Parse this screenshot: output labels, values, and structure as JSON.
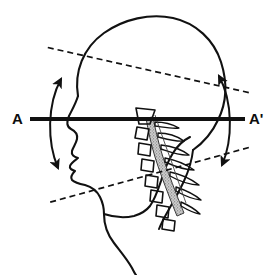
{
  "figure": {
    "kind": "anatomical-line-drawing",
    "background_color": "#ffffff",
    "ink_color": "#111111",
    "width": 276,
    "height": 275
  },
  "labels": {
    "axis_left": "A",
    "axis_right": "A'"
  },
  "reference_axis": {
    "name": "horizontal-reference-line-A-A-prime",
    "description": "thick solid horizontal line through the pivot point",
    "from": [
      30,
      119
    ],
    "to": [
      245,
      119
    ],
    "stroke_width": 4,
    "color": "#111111"
  },
  "pivot": {
    "name": "rotation-center",
    "x": 140,
    "y": 120
  },
  "dashed_lines": [
    {
      "name": "upper-oblique-dashed-line",
      "from": [
        33,
        72
      ],
      "to": [
        241,
        67
      ],
      "passes_through_pivot": true,
      "dash": "6 4"
    },
    {
      "name": "lower-oblique-dashed-line",
      "from": [
        37,
        178
      ],
      "to": [
        246,
        177
      ],
      "passes_through_pivot": true,
      "dash": "6 4"
    }
  ],
  "angle_arcs": [
    {
      "name": "left-range-of-motion-arc",
      "side": "left",
      "double_headed": true,
      "top_point": [
        61,
        77
      ],
      "bottom_point": [
        59,
        170
      ],
      "bulge": "outward-left"
    },
    {
      "name": "right-range-of-motion-arc",
      "side": "right",
      "double_headed": true,
      "top_point": [
        219,
        74
      ],
      "bottom_point": [
        222,
        166
      ],
      "bulge": "outward-right"
    }
  ],
  "anatomy": {
    "cranium": "rounded skull vault outline",
    "face_profile": "forehead, brow, nose, lips, chin profile",
    "jaw_and_throat": "mandible and anterior neck contour",
    "posterior_neck": "back of neck contour",
    "cervical_spine": {
      "vertebral_body_count": 7,
      "spinal_canal": "stippled / shaded curved band",
      "spinous_processes": "posterior wing-shaped projections"
    }
  }
}
